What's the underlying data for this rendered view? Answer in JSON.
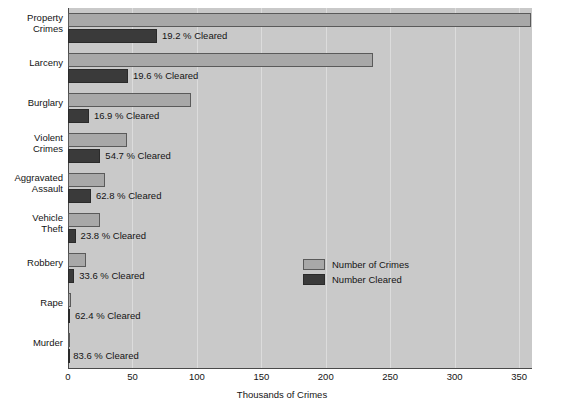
{
  "chart_data": {
    "type": "bar",
    "title": "",
    "xlabel": "Thousands of Crimes",
    "ylabel": "",
    "orientation": "horizontal",
    "xlim": [
      0,
      360
    ],
    "xticks": [
      0,
      50,
      100,
      150,
      200,
      250,
      300,
      350
    ],
    "xtick_labels": [
      "0",
      "50",
      "100",
      "150",
      "200",
      "250",
      "300",
      "350"
    ],
    "grid": true,
    "legend_position": "center-right",
    "categories": [
      "Property Crimes",
      "Larceny",
      "Burglary",
      "Violent Crimes",
      "Aggravated Assault",
      "Vehicle Theft",
      "Robbery",
      "Rape",
      "Murder"
    ],
    "category_lines": [
      [
        "Property",
        "Crimes"
      ],
      [
        "Larceny"
      ],
      [
        "Burglary"
      ],
      [
        "Violent",
        "Crimes"
      ],
      [
        "Aggravated",
        "Assault"
      ],
      [
        "Vehicle",
        "Theft"
      ],
      [
        "Robbery"
      ],
      [
        "Rape"
      ],
      [
        "Murder"
      ]
    ],
    "series": [
      {
        "name": "Number of Crimes",
        "color": "#a8a8a8",
        "values": [
          359.0,
          237.0,
          95.6,
          45.8,
          28.4,
          24.6,
          14.2,
          2.6,
          0.2
        ]
      },
      {
        "name": "Number Cleared",
        "color": "#3a3a3a",
        "values": [
          69.0,
          46.5,
          16.2,
          25.1,
          17.8,
          5.9,
          4.8,
          1.6,
          0.17
        ]
      }
    ],
    "annotations": [
      "19.2 % Cleared",
      "19.6 % Cleared",
      "16.9 % Cleared",
      "54.7 % Cleared",
      "62.8 % Cleared",
      "23.8 % Cleared",
      "33.6 % Cleared",
      "62.4 % Cleared",
      "83.6 % Cleared"
    ],
    "cleared_percent": [
      19.2,
      19.6,
      16.9,
      54.7,
      62.8,
      23.8,
      33.6,
      62.4,
      83.6
    ]
  },
  "legend": {
    "items": [
      {
        "label": "Number of Crimes",
        "color": "#a8a8a8"
      },
      {
        "label": "Number Cleared",
        "color": "#3a3a3a"
      }
    ]
  },
  "axis": {
    "x_title": "Thousands of Crimes"
  },
  "colors": {
    "plot_background": "#c9c9c9",
    "gridline": "#dcdcdc",
    "axis": "#4a4a4a",
    "total_bar": "#a8a8a8",
    "cleared_bar": "#3a3a3a",
    "text": "#141414"
  }
}
